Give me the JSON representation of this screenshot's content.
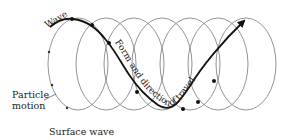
{
  "diagram": {
    "title": "Surface wave",
    "labels": {
      "wave": "Wave",
      "particle_motion_line1": "Particle",
      "particle_motion_line2": "motion",
      "form_direction": "Form and direction of travel",
      "caption": "Surface wave"
    },
    "colors": {
      "ellipse_stroke": "#777777",
      "wave_stroke": "#111111",
      "text": "#222222"
    }
  }
}
